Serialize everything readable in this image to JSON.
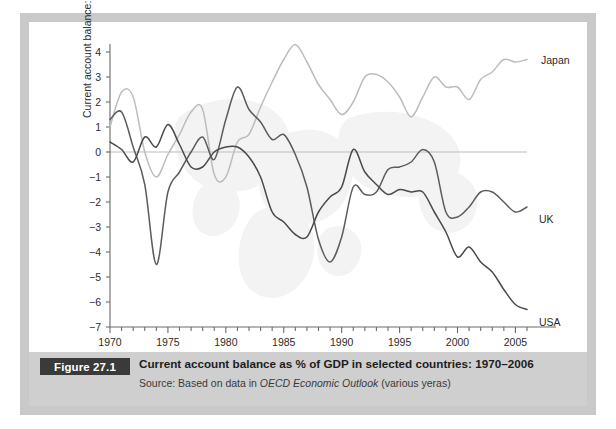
{
  "figure": {
    "badge": "Figure 27.1",
    "title": "Current account balance as % of GDP in selected countries: 1970–2006",
    "source_prefix": "Source: Based on data in ",
    "source_italic": "OECD Economic Outlook",
    "source_suffix": " (various yeras)"
  },
  "colors": {
    "frame": "#c9c9c9",
    "caption_band": "#cfcfcf",
    "badge_bg": "#3a3a3a",
    "badge_text": "#ffffff",
    "axis": "#6b6b6b",
    "zero_line": "#bdbdbd",
    "japan": "#bcbcbc",
    "uk": "#5c5c5c",
    "usa": "#4a4a4a",
    "watermark": "#f2f2f2"
  },
  "chart_data": {
    "type": "line",
    "title": "Current account balance as % of GDP in selected countries: 1970–2006",
    "xlabel": "",
    "ylabel": "Current account balance: % of GDP",
    "xlim": [
      1970,
      2006
    ],
    "ylim": [
      -7,
      4
    ],
    "ytick_labels": [
      "4",
      "3",
      "2",
      "1",
      "0",
      "−1",
      "−2",
      "−3",
      "−4",
      "−5",
      "−6",
      "−7"
    ],
    "yticks": [
      4,
      3,
      2,
      1,
      0,
      -1,
      -2,
      -3,
      -4,
      -5,
      -6,
      -7
    ],
    "xtick_labels": [
      "1970",
      "1975",
      "1980",
      "1985",
      "1990",
      "1995",
      "2000",
      "2005"
    ],
    "xticks": [
      1970,
      1975,
      1980,
      1985,
      1990,
      1995,
      2000,
      2005
    ],
    "minor_xtick_step": 1,
    "grid": false,
    "legend": "inline-labels-at-line-end",
    "x": [
      1970,
      1971,
      1972,
      1973,
      1974,
      1975,
      1976,
      1977,
      1978,
      1979,
      1980,
      1981,
      1982,
      1983,
      1984,
      1985,
      1986,
      1987,
      1988,
      1989,
      1990,
      1991,
      1992,
      1993,
      1994,
      1995,
      1996,
      1997,
      1998,
      1999,
      2000,
      2001,
      2002,
      2003,
      2004,
      2005,
      2006
    ],
    "series": [
      {
        "name": "Japan",
        "label": "Japan",
        "color": "#bcbcbc",
        "values": [
          1.0,
          2.4,
          2.2,
          0.0,
          -1.0,
          -0.1,
          0.7,
          1.6,
          1.7,
          -0.9,
          -1.0,
          0.4,
          0.7,
          1.8,
          2.8,
          3.7,
          4.3,
          3.6,
          2.7,
          2.1,
          1.5,
          2.0,
          3.0,
          3.1,
          2.8,
          2.2,
          1.4,
          2.2,
          3.0,
          2.6,
          2.6,
          2.1,
          2.9,
          3.2,
          3.7,
          3.6,
          3.7
        ]
      },
      {
        "name": "UK",
        "label": "UK",
        "color": "#5c5c5c",
        "values": [
          1.3,
          1.6,
          0.2,
          -1.3,
          -4.5,
          -1.6,
          -0.8,
          0.0,
          0.6,
          -0.3,
          1.3,
          2.6,
          1.7,
          1.2,
          0.5,
          0.7,
          -0.1,
          -1.4,
          -3.5,
          -4.4,
          -3.4,
          -1.4,
          -1.7,
          -1.6,
          -0.7,
          -0.6,
          -0.4,
          0.1,
          -0.4,
          -2.4,
          -2.6,
          -2.2,
          -1.6,
          -1.6,
          -2.0,
          -2.4,
          -2.2
        ]
      },
      {
        "name": "USA",
        "label": "USA",
        "color": "#4a4a4a",
        "values": [
          0.4,
          0.1,
          -0.4,
          0.6,
          0.2,
          1.1,
          0.3,
          -0.6,
          -0.6,
          0.0,
          0.2,
          0.2,
          -0.2,
          -1.0,
          -2.4,
          -2.8,
          -3.3,
          -3.4,
          -2.4,
          -1.8,
          -1.4,
          0.1,
          -0.8,
          -1.3,
          -1.7,
          -1.5,
          -1.6,
          -1.6,
          -2.4,
          -3.2,
          -4.2,
          -3.8,
          -4.4,
          -4.8,
          -5.5,
          -6.1,
          -6.3
        ]
      }
    ]
  }
}
